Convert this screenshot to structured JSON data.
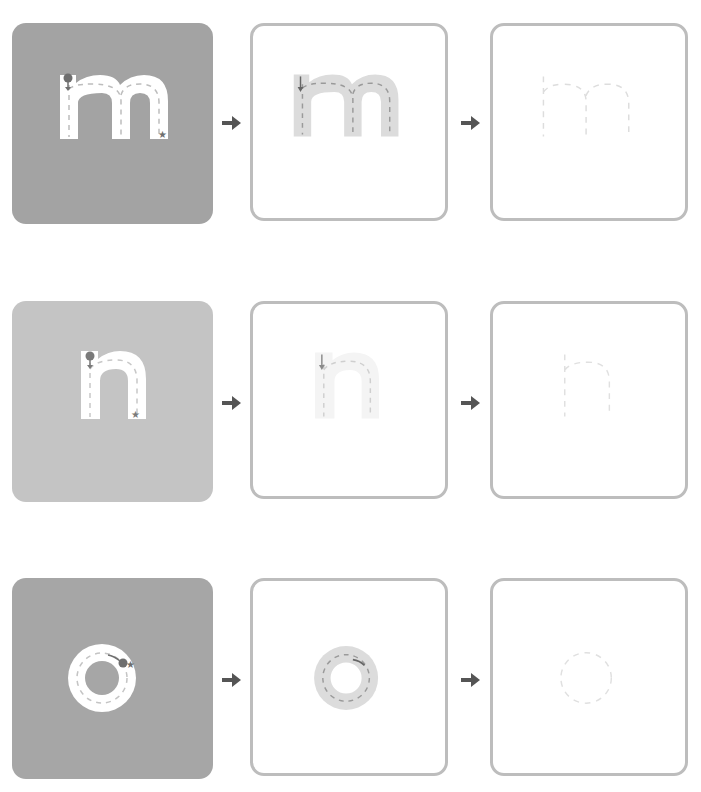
{
  "worksheet": {
    "title": "Letter tracing: m, n, o",
    "rows": [
      {
        "letter": "m",
        "model_card_color": "#a3a3a3",
        "steps": [
          "model",
          "trace-guided",
          "trace-faint"
        ]
      },
      {
        "letter": "n",
        "model_card_color": "#c4c4c4",
        "steps": [
          "model",
          "trace-guided",
          "trace-faint"
        ]
      },
      {
        "letter": "o",
        "model_card_color": "#a6a6a6",
        "steps": [
          "model",
          "trace-guided",
          "trace-faint"
        ]
      }
    ],
    "colors": {
      "card_border": "#bdbdbd",
      "arrow": "#555555",
      "guide_fill": "#dcdcdc",
      "guide_fill_faint": "#f4f4f4",
      "dash_dark": "#9a9a9a",
      "dash_light": "#dddddd",
      "start_dot": "#777777"
    },
    "icons": {
      "next": "arrow-right-icon",
      "start": "start-dot-icon",
      "end": "star-icon"
    }
  }
}
